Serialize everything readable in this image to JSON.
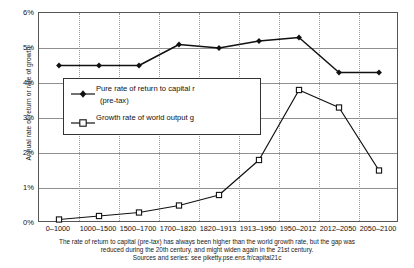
{
  "chart_data": {
    "type": "line",
    "title": "",
    "xlabel": "",
    "ylabel": "Annual rate of return or rate of growth",
    "ylim": [
      0,
      6
    ],
    "yticks": [
      "0%",
      "1%",
      "2%",
      "3%",
      "4%",
      "5%",
      "6%"
    ],
    "ytick_values": [
      0,
      1,
      2,
      3,
      4,
      5,
      6
    ],
    "grid": true,
    "legend_position": "upper-left-inside",
    "categories": [
      "0–1000",
      "1000–1500",
      "1500–1700",
      "1700–1820",
      "1820–1913",
      "1913–1950",
      "1950–2012",
      "2012–2050",
      "2050–2100"
    ],
    "series": [
      {
        "name": "Pure rate of return to capital r (pre-tax)",
        "marker": "filled-diamond",
        "values": [
          4.5,
          4.5,
          4.5,
          5.1,
          5.0,
          5.2,
          5.3,
          4.3,
          4.3
        ]
      },
      {
        "name": "Growth rate of world output g",
        "marker": "open-square",
        "values": [
          0.1,
          0.2,
          0.3,
          0.5,
          0.8,
          1.8,
          3.8,
          3.3,
          1.5
        ]
      }
    ]
  },
  "legend": {
    "entries": [
      {
        "label_line1": "Pure rate of return to capital r",
        "label_line2": "(pre-tax)"
      },
      {
        "label_line1": "Growth rate of world output g",
        "label_line2": ""
      }
    ]
  },
  "caption": {
    "line1": "The rate of return to capital (pre-tax) has always been higher than the world growth rate, but the gap was",
    "line2": "reduced during the 20th century, and might widen again in the 21st century.",
    "line3": "Sources and series: see piketty.pse.ens.fr/capital21c"
  },
  "colors": {
    "series_r": "#111111",
    "series_g": "#111111",
    "grid": "#8f8f8f",
    "vgrid": "#9a9a9a",
    "axis": "#555555",
    "text": "#111111",
    "background": "#ffffff"
  }
}
